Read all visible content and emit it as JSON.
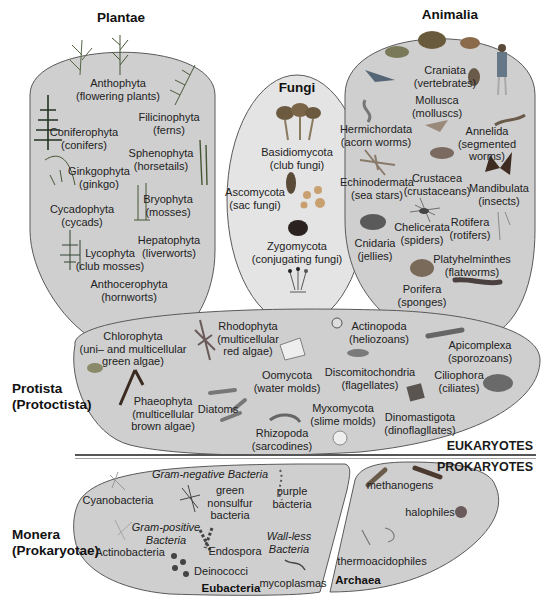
{
  "colors": {
    "region_fill": "#cfcfcf",
    "region_stroke": "#5a5a5a",
    "background": "#ffffff",
    "divider": "#555555"
  },
  "kingdoms": {
    "plantae": {
      "title": "Plantae",
      "phyla": [
        {
          "name": "Anthophyta",
          "common": "(flowering plants)"
        },
        {
          "name": "Filicinophyta",
          "common": "(ferns)"
        },
        {
          "name": "Coniferophyta",
          "common": "(conifers)"
        },
        {
          "name": "Sphenophyta",
          "common": "(horsetails)"
        },
        {
          "name": "Ginkgophyta",
          "common": "(ginkgo)"
        },
        {
          "name": "Bryophyta",
          "common": "(mosses)"
        },
        {
          "name": "Cycadophyta",
          "common": "(cycads)"
        },
        {
          "name": "Hepatophyta",
          "common": "(liverworts)"
        },
        {
          "name": "Lycophyta",
          "common": "(club mosses)"
        },
        {
          "name": "Anthocerophyta",
          "common": "(hornworts)"
        }
      ]
    },
    "fungi": {
      "title": "Fungi",
      "phyla": [
        {
          "name": "Basidiomycota",
          "common": "(club fungi)"
        },
        {
          "name": "Ascomycota",
          "common": "(sac fungi)"
        },
        {
          "name": "Zygomycota",
          "common": "(conjugating fungi)"
        }
      ]
    },
    "animalia": {
      "title": "Animalia",
      "phyla": [
        {
          "name": "Craniata",
          "common": "(vertebrates)"
        },
        {
          "name": "Mollusca",
          "common": "(molluscs)"
        },
        {
          "name": "Hermichordata",
          "common": "(acorn worms)"
        },
        {
          "name": "Annelida",
          "common": "(segmented",
          "common2": "worms)"
        },
        {
          "name": "Echinodermata",
          "common": "(sea stars)"
        },
        {
          "name": "Crustacea",
          "common": "(crustaceans)"
        },
        {
          "name": "Mandibulata",
          "common": "(insects)"
        },
        {
          "name": "Chelicerata",
          "common": "(spiders)"
        },
        {
          "name": "Rotifera",
          "common": "(rotifers)"
        },
        {
          "name": "Cnidaria",
          "common": "(jellies)"
        },
        {
          "name": "Platyhelminthes",
          "common": "(flatworms)"
        },
        {
          "name": "Porifera",
          "common": "(sponges)"
        }
      ]
    },
    "protista": {
      "title": "Protista",
      "title2": "(Protoctista)",
      "phyla": [
        {
          "name": "Chlorophyta",
          "common": "(uni– and multicellular",
          "common2": "green algae)"
        },
        {
          "name": "Rhodophyta",
          "common": "(multicellular",
          "common2": "red algae)"
        },
        {
          "name": "Actinopoda",
          "common": "(heliozoans)"
        },
        {
          "name": "Apicomplexa",
          "common": "(sporozoans)"
        },
        {
          "name": "Oomycota",
          "common": "(water molds)"
        },
        {
          "name": "Discomitochondria",
          "common": "(flagellates)"
        },
        {
          "name": "Ciliophora",
          "common": "(ciliates)"
        },
        {
          "name": "Phaeophyta",
          "common": "(multicellular",
          "common2": "brown algae)"
        },
        {
          "name": "Diatoms",
          "common": ""
        },
        {
          "name": "Myxomycota",
          "common": "(slime molds)"
        },
        {
          "name": "Dinomastigota",
          "common": "(dinoflagllates)"
        },
        {
          "name": "Rhizopoda",
          "common": "(sarcodines)"
        }
      ]
    },
    "monera": {
      "title": "Monera",
      "title2": "(Prokaryotae)",
      "eubacteria": {
        "label": "Eubacteria",
        "gram_negative": "Gram-negative Bacteria",
        "gram_positive": "Gram-positive",
        "gram_positive2": "Bacteria",
        "wall_less": "Wall-less",
        "wall_less2": "Bacteria",
        "groups": {
          "cyanobacteria": "Cyanobacteria",
          "green_nonsulfur": [
            "green",
            "nonsulfur",
            "bacteria"
          ],
          "purple": [
            "purple",
            "bacteria"
          ],
          "actinobacteria": "Actinobacteria",
          "endospora": "Endospora",
          "deinococci": "Deinococci",
          "mycoplasmas": "mycoplasmas"
        }
      },
      "archaea": {
        "label": "Archaea",
        "groups": {
          "methanogens": "methanogens",
          "halophiles": "halophiles",
          "thermoacidophiles": "thermoacidophiles"
        }
      }
    }
  },
  "sections": {
    "eukaryotes": "EUKARYOTES",
    "prokaryotes": "PROKARYOTES"
  }
}
